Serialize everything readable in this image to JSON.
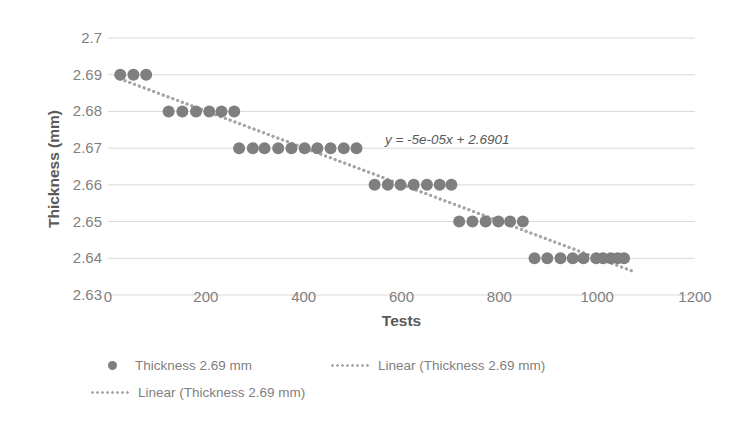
{
  "chart_data": {
    "type": "scatter",
    "title": "",
    "xlabel": "Tests",
    "ylabel": "Thickness (mm)",
    "xlim": [
      0,
      1200
    ],
    "ylim": [
      2.63,
      2.7
    ],
    "xticks": [
      0,
      200,
      400,
      600,
      800,
      1000,
      1200
    ],
    "yticks": [
      2.63,
      2.64,
      2.65,
      2.66,
      2.67,
      2.68,
      2.69,
      2.7
    ],
    "xtick_labels": [
      "0",
      "200",
      "400",
      "600",
      "800",
      "1000",
      "1200"
    ],
    "ytick_labels": [
      "2.63",
      "2.64",
      "2.65",
      "2.66",
      "2.67",
      "2.68",
      "2.69",
      "2.7"
    ],
    "grid": "horizontal",
    "legend_position": "bottom",
    "marker_color": "#7f7f7f",
    "trendline_color": "#a6a6a6",
    "gridline_color": "#d9d9d9",
    "series": [
      {
        "name": "Thickness 2.69 mm",
        "kind": "scatter",
        "x": [
          25,
          52,
          78,
          124,
          152,
          180,
          207,
          232,
          258,
          268,
          296,
          320,
          348,
          375,
          402,
          428,
          455,
          482,
          508,
          545,
          572,
          598,
          625,
          652,
          678,
          702,
          718,
          745,
          772,
          798,
          822,
          848,
          872,
          898,
          925,
          950,
          972,
          998,
          1012,
          1028,
          1042,
          1055
        ],
        "y": [
          2.69,
          2.69,
          2.69,
          2.68,
          2.68,
          2.68,
          2.68,
          2.68,
          2.68,
          2.67,
          2.67,
          2.67,
          2.67,
          2.67,
          2.67,
          2.67,
          2.67,
          2.67,
          2.67,
          2.66,
          2.66,
          2.66,
          2.66,
          2.66,
          2.66,
          2.66,
          2.65,
          2.65,
          2.65,
          2.65,
          2.65,
          2.65,
          2.64,
          2.64,
          2.64,
          2.64,
          2.64,
          2.64,
          2.64,
          2.64,
          2.64,
          2.64
        ]
      },
      {
        "name": "Linear (Thickness 2.69 mm)",
        "kind": "trendline",
        "slope": -5e-05,
        "intercept": 2.6901,
        "x_range": [
          25,
          1075
        ]
      },
      {
        "name": "Linear (Thickness 2.69 mm)",
        "kind": "trendline",
        "slope": -5e-05,
        "intercept": 2.6901,
        "x_range": [
          25,
          1075
        ]
      }
    ],
    "annotations": [
      {
        "name": "trendline-equation",
        "text": "y = -5e-05x + 2.6901",
        "x": 750,
        "y": 2.672
      }
    ]
  },
  "legend": {
    "entries": [
      {
        "label": "Thickness 2.69 mm",
        "marker": "dot-marker-icon"
      },
      {
        "label": "Linear (Thickness 2.69 mm)",
        "marker": "dotted-line-icon"
      },
      {
        "label": "Linear (Thickness 2.69 mm)",
        "marker": "dotted-line-icon"
      }
    ]
  }
}
